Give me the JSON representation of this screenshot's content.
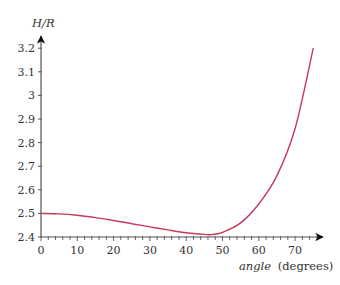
{
  "chart_data": {
    "type": "line",
    "title": "",
    "xlabel": "angle (degrees)",
    "xlabel_italic": "angle",
    "xlabel_unit": "(degrees)",
    "ylabel": "H/R",
    "xlim": [
      0,
      75
    ],
    "ylim": [
      2.4,
      3.2
    ],
    "x_ticks": [
      0,
      10,
      20,
      30,
      40,
      50,
      60,
      70
    ],
    "x_tick_labels": [
      "0",
      "10",
      "20",
      "30",
      "40",
      "50",
      "60",
      "70"
    ],
    "y_ticks": [
      2.4,
      2.5,
      2.6,
      2.7,
      2.8,
      2.9,
      3.0,
      3.1,
      3.2
    ],
    "y_tick_labels": [
      "2.4",
      "2.5",
      "2.6",
      "2.7",
      "2.8",
      "2.9",
      "3",
      "3.1",
      "3.2"
    ],
    "grid": false,
    "legend": null,
    "series": [
      {
        "name": "H/R",
        "color": "#c8385a",
        "x": [
          0,
          5,
          10,
          15,
          20,
          25,
          30,
          35,
          40,
          45,
          47,
          50,
          55,
          60,
          65,
          70,
          75
        ],
        "y": [
          2.5,
          2.498,
          2.492,
          2.482,
          2.47,
          2.456,
          2.443,
          2.43,
          2.418,
          2.411,
          2.41,
          2.42,
          2.46,
          2.54,
          2.66,
          2.86,
          3.2
        ]
      }
    ]
  },
  "axis_color": "#444444"
}
